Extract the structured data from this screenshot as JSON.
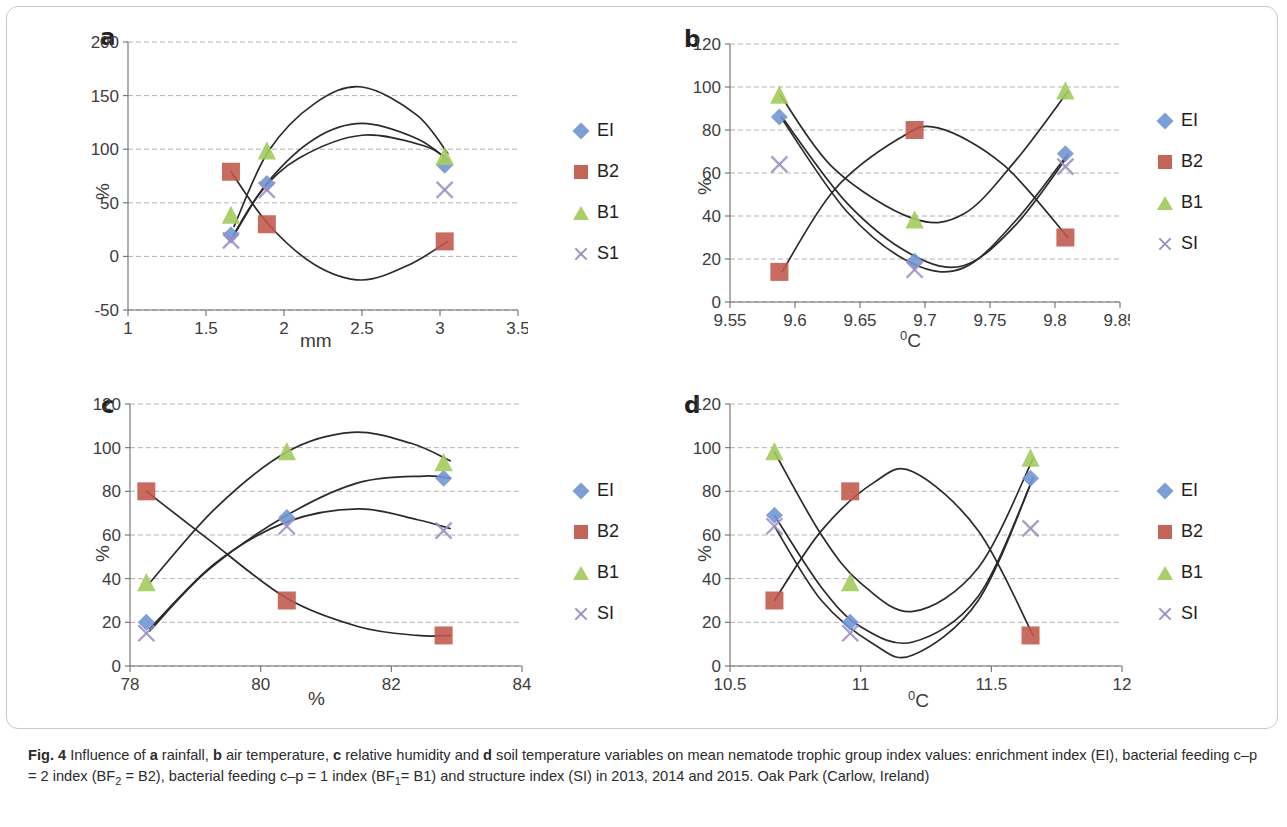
{
  "figure": {
    "label": "Fig. 4",
    "caption_runs": [
      {
        "t": "Fig. 4",
        "b": true
      },
      {
        "t": "  Influence of ",
        "b": false
      },
      {
        "t": "a",
        "b": true
      },
      {
        "t": " rainfall, ",
        "b": false
      },
      {
        "t": "b",
        "b": true
      },
      {
        "t": " air temperature, ",
        "b": false
      },
      {
        "t": "c",
        "b": true
      },
      {
        "t": " relative humidity and ",
        "b": false
      },
      {
        "t": "d",
        "b": true
      },
      {
        "t": " soil temperature variables on mean nematode trophic group index values: enrichment index (EI), bacterial feeding c–p = 2 index (BF",
        "b": false
      },
      {
        "t": "2",
        "b": false,
        "sub": true
      },
      {
        "t": " = B2), bacterial feeding c–p = 1 index (BF",
        "b": false
      },
      {
        "t": "1",
        "b": false,
        "sub": true
      },
      {
        "t": "= B1) and structure index (SI) in 2013, 2014 and 2015. Oak Park (Carlow, Ireland)",
        "b": false
      }
    ],
    "caption_plain": "Fig. 4  Influence of a rainfall, b air temperature, c relative humidity and d soil temperature variables on mean nematode trophic group index values: enrichment index (EI), bacterial feeding c–p = 2 index (BF2 = B2), bacterial feeding c–p = 1 index (BF1= B1) and structure index (SI) in 2013, 2014 and 2015. Oak Park (Carlow, Ireland)"
  },
  "series_colors": {
    "EI": "#7296d4",
    "B2": "#c0574a",
    "B1": "#a4cb5f",
    "SI": "#9c8fc4",
    "trendline": "#2b2b2b",
    "gridline": "#9a9a9a",
    "axis": "#6e6e6e"
  },
  "chart_data": [
    {
      "id": "panel-a",
      "letter": "a",
      "type": "scatter",
      "title": "",
      "xlabel": "mm",
      "ylabel": "%",
      "variable": "rainfall",
      "xlim": [
        1,
        3.5
      ],
      "ylim": [
        -50,
        200
      ],
      "xticks": [
        1,
        1.5,
        2,
        2.5,
        3,
        3.5
      ],
      "xticklabels": [
        "1",
        "1.5",
        "2",
        "2.5",
        "3",
        "3.5"
      ],
      "yticks": [
        -50,
        0,
        50,
        100,
        150,
        200
      ],
      "yticklabels": [
        "-50",
        "0",
        "50",
        "100",
        "150",
        "200"
      ],
      "grid": true,
      "legend_position": "right",
      "x": [
        1.66,
        1.89,
        3.03
      ],
      "series": [
        {
          "name": "EI",
          "marker": "diamond",
          "values": [
            20,
            68,
            85
          ],
          "trend": [
            [
              1.66,
              16
            ],
            [
              1.85,
              60
            ],
            [
              2.1,
              92
            ],
            [
              2.5,
              113
            ],
            [
              2.9,
              103
            ],
            [
              3.05,
              90
            ]
          ]
        },
        {
          "name": "B2",
          "marker": "square",
          "values": [
            79,
            30,
            14
          ],
          "trend": [
            [
              1.66,
              79
            ],
            [
              1.9,
              30
            ],
            [
              2.2,
              -8
            ],
            [
              2.5,
              -22
            ],
            [
              2.8,
              -8
            ],
            [
              3.05,
              14
            ]
          ]
        },
        {
          "name": "B1",
          "marker": "triangle",
          "values": [
            38,
            98,
            93
          ],
          "trend": [
            [
              1.68,
              28
            ],
            [
              1.9,
              98
            ],
            [
              2.2,
              143
            ],
            [
              2.5,
              158
            ],
            [
              2.85,
              132
            ],
            [
              3.05,
              96
            ]
          ]
        },
        {
          "name": "SI",
          "marker": "cross",
          "values": [
            15,
            62,
            62
          ],
          "trend": [
            [
              1.68,
              20
            ],
            [
              1.9,
              70
            ],
            [
              2.2,
              110
            ],
            [
              2.5,
              124
            ],
            [
              2.85,
              110
            ],
            [
              3.05,
              90
            ]
          ]
        }
      ]
    },
    {
      "id": "panel-b",
      "letter": "b",
      "type": "scatter",
      "title": "",
      "xlabel": "⁰C",
      "ylabel": "%",
      "variable": "air temperature",
      "xlim": [
        9.55,
        9.85
      ],
      "ylim": [
        0,
        120
      ],
      "xticks": [
        9.55,
        9.6,
        9.65,
        9.7,
        9.75,
        9.8,
        9.85
      ],
      "xticklabels": [
        "9.55",
        "9.6",
        "9.65",
        "9.7",
        "9.75",
        "9.8",
        "9.85"
      ],
      "yticks": [
        0,
        20,
        40,
        60,
        80,
        100,
        120
      ],
      "yticklabels": [
        "0",
        "20",
        "40",
        "60",
        "80",
        "100",
        "120"
      ],
      "grid": true,
      "legend_position": "right",
      "x": [
        9.588,
        9.692,
        9.808
      ],
      "series": [
        {
          "name": "EI",
          "marker": "diamond",
          "values": [
            86,
            19,
            69
          ],
          "trend": [
            [
              9.59,
              86
            ],
            [
              9.64,
              46
            ],
            [
              9.69,
              22
            ],
            [
              9.73,
              17
            ],
            [
              9.77,
              36
            ],
            [
              9.81,
              68
            ]
          ]
        },
        {
          "name": "B2",
          "marker": "square",
          "values": [
            14,
            80,
            30
          ],
          "trend": [
            [
              9.59,
              14
            ],
            [
              9.63,
              52
            ],
            [
              9.68,
              76
            ],
            [
              9.71,
              81
            ],
            [
              9.76,
              64
            ],
            [
              9.81,
              30
            ]
          ]
        },
        {
          "name": "B1",
          "marker": "triangle",
          "values": [
            96,
            38,
            98
          ],
          "trend": [
            [
              9.589,
              96
            ],
            [
              9.63,
              62
            ],
            [
              9.69,
              39
            ],
            [
              9.73,
              41
            ],
            [
              9.77,
              66
            ],
            [
              9.81,
              98
            ]
          ]
        },
        {
          "name": "SI",
          "marker": "cross",
          "values": [
            64,
            15,
            63
          ],
          "trend": [
            [
              9.589,
              86
            ],
            [
              9.64,
              42
            ],
            [
              9.69,
              18
            ],
            [
              9.73,
              16
            ],
            [
              9.77,
              38
            ],
            [
              9.81,
              69
            ]
          ]
        }
      ]
    },
    {
      "id": "panel-c",
      "letter": "c",
      "type": "scatter",
      "title": "",
      "xlabel": "%",
      "ylabel": "%",
      "variable": "relative humidity",
      "xlim": [
        78,
        84
      ],
      "ylim": [
        0,
        120
      ],
      "xticks": [
        78,
        80,
        82,
        84
      ],
      "xticklabels": [
        "78",
        "80",
        "82",
        "84"
      ],
      "yticks": [
        0,
        20,
        40,
        60,
        80,
        100,
        120
      ],
      "yticklabels": [
        "0",
        "20",
        "40",
        "60",
        "80",
        "100",
        "120"
      ],
      "grid": true,
      "legend_position": "right",
      "x": [
        78.25,
        80.4,
        82.8
      ],
      "series": [
        {
          "name": "EI",
          "marker": "diamond",
          "values": [
            20,
            68,
            86
          ],
          "trend": [
            [
              78.3,
              16
            ],
            [
              79.2,
              44
            ],
            [
              80.4,
              69
            ],
            [
              81.5,
              84
            ],
            [
              82.5,
              87
            ],
            [
              82.9,
              86
            ]
          ]
        },
        {
          "name": "B2",
          "marker": "square",
          "values": [
            80,
            30,
            14
          ],
          "trend": [
            [
              78.25,
              80
            ],
            [
              79.2,
              58
            ],
            [
              80.4,
              31
            ],
            [
              81.5,
              18
            ],
            [
              82.4,
              14
            ],
            [
              82.9,
              14
            ]
          ]
        },
        {
          "name": "B1",
          "marker": "triangle",
          "values": [
            38,
            98,
            93
          ],
          "trend": [
            [
              78.3,
              38
            ],
            [
              79.3,
              72
            ],
            [
              80.4,
              98
            ],
            [
              81.4,
              107
            ],
            [
              82.3,
              102
            ],
            [
              82.9,
              94
            ]
          ]
        },
        {
          "name": "SI",
          "marker": "cross",
          "values": [
            15,
            64,
            62
          ],
          "trend": [
            [
              78.3,
              17
            ],
            [
              79.3,
              47
            ],
            [
              80.4,
              66
            ],
            [
              81.5,
              72
            ],
            [
              82.4,
              67
            ],
            [
              82.9,
              63
            ]
          ]
        }
      ]
    },
    {
      "id": "panel-d",
      "letter": "d",
      "type": "scatter",
      "title": "",
      "xlabel": "⁰C",
      "ylabel": "%",
      "variable": "soil temperature",
      "xlim": [
        10.5,
        12
      ],
      "ylim": [
        0,
        120
      ],
      "xticks": [
        10.5,
        11,
        11.5,
        12
      ],
      "xticklabels": [
        "10.5",
        "11",
        "11.5",
        "12"
      ],
      "yticks": [
        0,
        20,
        40,
        60,
        80,
        100,
        120
      ],
      "yticklabels": [
        "0",
        "20",
        "40",
        "60",
        "80",
        "100",
        "120"
      ],
      "grid": true,
      "legend_position": "right",
      "x": [
        10.67,
        10.96,
        11.65
      ],
      "series": [
        {
          "name": "EI",
          "marker": "diamond",
          "values": [
            69,
            20,
            86
          ],
          "trend": [
            [
              10.67,
              69
            ],
            [
              10.85,
              36
            ],
            [
              11.0,
              18
            ],
            [
              11.2,
              11
            ],
            [
              11.45,
              32
            ],
            [
              11.66,
              86
            ]
          ]
        },
        {
          "name": "B2",
          "marker": "square",
          "values": [
            30,
            80,
            14
          ],
          "trend": [
            [
              10.67,
              30
            ],
            [
              10.85,
              62
            ],
            [
              11.05,
              84
            ],
            [
              11.2,
              89
            ],
            [
              11.45,
              62
            ],
            [
              11.66,
              14
            ]
          ]
        },
        {
          "name": "B1",
          "marker": "triangle",
          "values": [
            98,
            38,
            95
          ],
          "trend": [
            [
              10.67,
              98
            ],
            [
              10.85,
              60
            ],
            [
              11.0,
              38
            ],
            [
              11.2,
              25
            ],
            [
              11.45,
              45
            ],
            [
              11.66,
              95
            ]
          ]
        },
        {
          "name": "SI",
          "marker": "cross",
          "values": [
            64,
            15,
            63
          ],
          "trend": [
            [
              10.67,
              64
            ],
            [
              10.85,
              30
            ],
            [
              11.05,
              10
            ],
            [
              11.2,
              5
            ],
            [
              11.45,
              30
            ],
            [
              11.66,
              86
            ]
          ]
        }
      ]
    }
  ],
  "legend_items": [
    {
      "label": "EI",
      "marker": "diamond",
      "color": "#7296d4"
    },
    {
      "label": "B2",
      "marker": "square",
      "color": "#c0574a"
    },
    {
      "label": "B1",
      "marker": "triangle",
      "color": "#a4cb5f"
    },
    {
      "label": "SI",
      "marker": "cross",
      "color": "#9c8fc4"
    }
  ],
  "legend_labels_panel_a": [
    "EI",
    "B2",
    "B1",
    "S1"
  ]
}
